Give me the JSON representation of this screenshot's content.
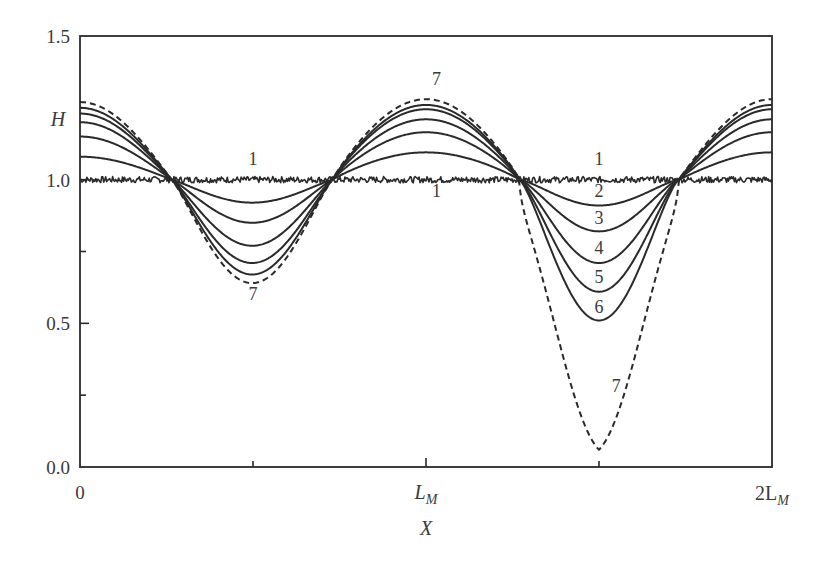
{
  "chart_data": {
    "type": "line",
    "title": "",
    "xlabel": "X",
    "ylabel": "H",
    "xlim": [
      0,
      2
    ],
    "ylim": [
      0.0,
      1.5
    ],
    "x_units": "L_M",
    "x_ticks": [
      {
        "value": 0,
        "label": "0",
        "major": true
      },
      {
        "value": 0.5,
        "label": "",
        "major": false
      },
      {
        "value": 1,
        "label": "L",
        "sub": "M",
        "major": true
      },
      {
        "value": 1.5,
        "label": "",
        "major": false
      },
      {
        "value": 2,
        "label": "2L",
        "sub": "M",
        "major": true
      }
    ],
    "y_ticks": [
      {
        "value": 0.0,
        "label": "0.0",
        "major": true
      },
      {
        "value": 0.25,
        "label": "",
        "major": false
      },
      {
        "value": 0.5,
        "label": "0.5",
        "major": true
      },
      {
        "value": 0.75,
        "label": "",
        "major": false
      },
      {
        "value": 1.0,
        "label": "1.0",
        "major": true
      },
      {
        "value": 1.25,
        "label": "",
        "major": false
      },
      {
        "value": 1.5,
        "label": "1.5",
        "major": true
      }
    ],
    "grid": false,
    "legend": "inline curve numbers",
    "crossing_points_x": [
      0.265,
      0.73,
      1.27,
      1.73
    ],
    "key_x": [
      0,
      0.5,
      1.0,
      1.5,
      2.0
    ],
    "series": [
      {
        "name": "1",
        "style": "solid-noisy",
        "values": [
          1.0,
          1.0,
          1.0,
          1.0,
          1.0
        ]
      },
      {
        "name": "2",
        "style": "solid",
        "values": [
          1.08,
          0.92,
          1.095,
          0.91,
          1.095
        ]
      },
      {
        "name": "3",
        "style": "solid",
        "values": [
          1.15,
          0.85,
          1.165,
          0.82,
          1.165
        ]
      },
      {
        "name": "4",
        "style": "solid",
        "values": [
          1.2,
          0.77,
          1.21,
          0.71,
          1.21
        ]
      },
      {
        "name": "5",
        "style": "solid",
        "values": [
          1.23,
          0.71,
          1.245,
          0.61,
          1.245
        ]
      },
      {
        "name": "6",
        "style": "solid",
        "values": [
          1.25,
          0.67,
          1.26,
          0.51,
          1.26
        ]
      },
      {
        "name": "7",
        "style": "dashed",
        "values": [
          1.27,
          0.64,
          1.28,
          0.06,
          1.28
        ]
      }
    ],
    "annotations": [
      {
        "text": "1",
        "x": 0.5,
        "y": 1.05
      },
      {
        "text": "1",
        "x": 1.03,
        "y": 0.94
      },
      {
        "text": "1",
        "x": 1.5,
        "y": 1.05
      },
      {
        "text": "2",
        "x": 1.5,
        "y": 0.94
      },
      {
        "text": "3",
        "x": 1.5,
        "y": 0.845
      },
      {
        "text": "4",
        "x": 1.5,
        "y": 0.74
      },
      {
        "text": "5",
        "x": 1.5,
        "y": 0.64
      },
      {
        "text": "6",
        "x": 1.5,
        "y": 0.535
      },
      {
        "text": "7",
        "x": 0.5,
        "y": 0.58
      },
      {
        "text": "7",
        "x": 1.03,
        "y": 1.33
      },
      {
        "text": "7",
        "x": 1.55,
        "y": 0.26
      }
    ]
  },
  "labels": {
    "y_axis": "H",
    "x_axis": "X",
    "x_tick_0": "0",
    "x_tick_1_main": "L",
    "x_tick_1_sub": "M",
    "x_tick_2_main": "2L",
    "x_tick_2_sub": "M",
    "y_tick_0": "0.0",
    "y_tick_05": "0.5",
    "y_tick_10": "1.0",
    "y_tick_15": "1.5"
  },
  "colors": {
    "line": "#2a2a2a",
    "text": "#3a3a3a",
    "background": "#ffffff"
  }
}
